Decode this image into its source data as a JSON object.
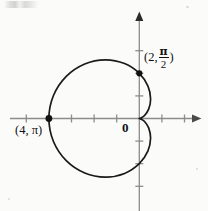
{
  "figure": {
    "title": "",
    "origin_label": "0"
  },
  "chart_data": {
    "type": "line",
    "curve_kind": "polar-cardioid",
    "equation": "r = 2 - 2 cos(theta)",
    "title": "",
    "xlabel": "",
    "ylabel": "",
    "grid": false,
    "legend": null,
    "xlim": [
      -5.2,
      2.6
    ],
    "ylim": [
      -3.6,
      3.4
    ],
    "axis_arrows": [
      "x-positive",
      "y-positive"
    ],
    "x_tick_values": [
      -5,
      -4,
      -3,
      -2,
      -1,
      1,
      2
    ],
    "y_tick_values": [
      -3,
      -2,
      -1,
      1,
      2,
      3
    ],
    "tick_labels_shown": false,
    "annotations": [
      {
        "name": "point-2-pi-over-2",
        "r": 2,
        "theta_text": "π/2",
        "cartesian": [
          0,
          2
        ],
        "label_prefix": "(2,",
        "label_numerator": "π",
        "label_denominator": "2",
        "label_suffix": ")",
        "marker": "filled-dot"
      },
      {
        "name": "point-4-pi",
        "r": 4,
        "theta_text": "π",
        "cartesian": [
          -4,
          0
        ],
        "label_text": "(4, π)",
        "marker": "filled-dot"
      }
    ],
    "series": [
      {
        "name": "cardioid",
        "color": "#1a1a1a",
        "points_polar_deg": [
          {
            "theta": 0,
            "r": 0.0
          },
          {
            "theta": 15,
            "r": 0.068
          },
          {
            "theta": 30,
            "r": 0.268
          },
          {
            "theta": 45,
            "r": 0.586
          },
          {
            "theta": 60,
            "r": 1.0
          },
          {
            "theta": 75,
            "r": 1.482
          },
          {
            "theta": 90,
            "r": 2.0
          },
          {
            "theta": 105,
            "r": 2.518
          },
          {
            "theta": 120,
            "r": 3.0
          },
          {
            "theta": 135,
            "r": 3.414
          },
          {
            "theta": 150,
            "r": 3.732
          },
          {
            "theta": 165,
            "r": 3.932
          },
          {
            "theta": 180,
            "r": 4.0
          },
          {
            "theta": 195,
            "r": 3.932
          },
          {
            "theta": 210,
            "r": 3.732
          },
          {
            "theta": 225,
            "r": 3.414
          },
          {
            "theta": 240,
            "r": 3.0
          },
          {
            "theta": 255,
            "r": 2.518
          },
          {
            "theta": 270,
            "r": 2.0
          },
          {
            "theta": 285,
            "r": 1.482
          },
          {
            "theta": 300,
            "r": 1.0
          },
          {
            "theta": 315,
            "r": 0.586
          },
          {
            "theta": 330,
            "r": 0.268
          },
          {
            "theta": 345,
            "r": 0.068
          },
          {
            "theta": 360,
            "r": 0.0
          }
        ]
      }
    ],
    "colors": {
      "curve": "#1a1a1a",
      "axis": "#8c8c8c",
      "text": "#111111",
      "background": "#fbfbfa"
    }
  }
}
